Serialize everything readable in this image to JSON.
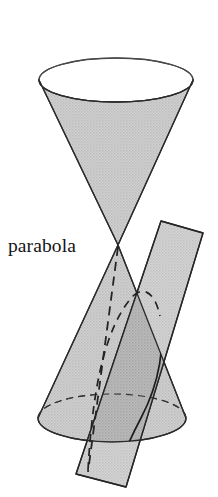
{
  "figure": {
    "title": "parabola",
    "canvas": {
      "width": 218,
      "height": 497,
      "background": "#ffffff"
    },
    "labels": [
      {
        "name": "parabola",
        "text": "parabola",
        "x": 8,
        "y": 252
      }
    ],
    "colors": {
      "cone_fill": "#c9c9c9",
      "plane_fill": "#c2c2c2",
      "overlap_fill": "#a8a8a8",
      "outline": "#2b2b2b",
      "curve": "#1e1e1e",
      "hidden_dash": "#222222",
      "background": "#ffffff",
      "label": "#151515"
    },
    "geometry": {
      "upper_cone": {
        "top_ellipse": {
          "cx": 116,
          "cy": 80,
          "rx": 77,
          "ry": 22
        },
        "apex": {
          "x": 118,
          "y": 245
        }
      },
      "lower_cone": {
        "apex": {
          "x": 118,
          "y": 245
        },
        "base_ellipse": {
          "cx": 112,
          "cy": 418,
          "rx": 74,
          "ry": 24
        }
      },
      "plane_rect": {
        "corners": [
          {
            "x": 161,
            "y": 221
          },
          {
            "x": 203,
            "y": 233
          },
          {
            "x": 126,
            "y": 487
          },
          {
            "x": 76,
            "y": 474
          }
        ]
      },
      "parabola_curve": {
        "visible": "solid arc on near surface of lower cone",
        "hidden": "dashed arc on far surface of lower cone"
      }
    }
  }
}
